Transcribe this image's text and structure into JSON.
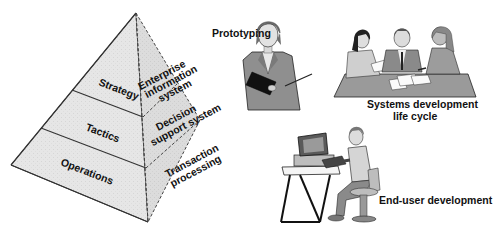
{
  "pyramid": {
    "levels": [
      {
        "label": "Strategy",
        "system_lines": [
          "Enterprise",
          "information",
          "system"
        ]
      },
      {
        "label": "Tactics",
        "system_lines": [
          "Decision",
          "support system"
        ]
      },
      {
        "label": "Operations",
        "system_lines": [
          "Transaction",
          "processing"
        ]
      }
    ],
    "colors": {
      "left_face": "#e6e6e6",
      "right_face": "#dcdcdc",
      "edge": "#333333"
    }
  },
  "methods": [
    {
      "label": "Prototyping",
      "figure": "person-holding-folder"
    },
    {
      "label_lines": [
        "Systems development",
        "life cycle"
      ],
      "figure": "team-meeting-at-table"
    },
    {
      "label": "End-user development",
      "figure": "person-at-computer"
    }
  ]
}
